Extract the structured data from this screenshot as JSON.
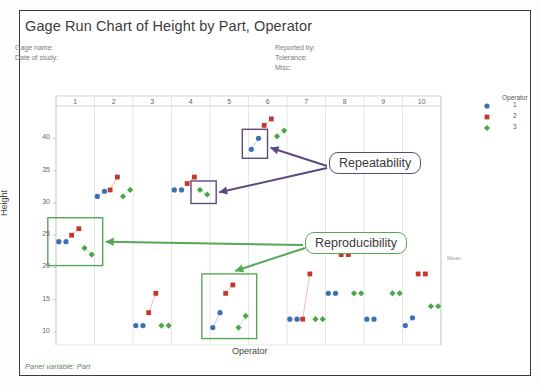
{
  "window": {
    "title": "Gage Run Chart of Height by Part, Operator"
  },
  "header": {
    "left": [
      "Gage name:",
      "Date of study:"
    ],
    "right": [
      "Reported by:",
      "Tolerance:",
      "Misc:"
    ]
  },
  "footnote": "Panel variable: Part",
  "mean_label": "Mean",
  "legend": {
    "title": "Operator",
    "entries": [
      {
        "label": "1",
        "marker": "circle",
        "color": "#3b6fb6"
      },
      {
        "label": "2",
        "marker": "square",
        "color": "#c0392b"
      },
      {
        "label": "3",
        "marker": "diamond",
        "color": "#4ca64c"
      }
    ]
  },
  "annotations": [
    {
      "name": "repeatability",
      "text": "Repeatability",
      "color": "#5b4a80"
    },
    {
      "name": "reproducibility",
      "text": "Reproducibility",
      "color": "#55a856"
    }
  ],
  "chart_data": {
    "type": "scatter",
    "title": "Gage Run Chart of Height by Part, Operator",
    "xlabel": "Operator",
    "ylabel": "Height",
    "panel_variable": "Part",
    "ylim": [
      8,
      45
    ],
    "yticks": [
      10,
      15,
      20,
      25,
      30,
      35,
      40
    ],
    "panels": [
      "1",
      "2",
      "3",
      "4",
      "5",
      "6",
      "7",
      "8",
      "9",
      "10"
    ],
    "grid": true,
    "legend_position": "right",
    "series": [
      {
        "name": "1",
        "marker": "circle",
        "color": "#3b6fb6",
        "points": [
          {
            "panel": "1",
            "reps": [
              24.0,
              24.0
            ]
          },
          {
            "panel": "2",
            "reps": [
              31.0,
              31.8
            ]
          },
          {
            "panel": "3",
            "reps": [
              11.0,
              11.0
            ]
          },
          {
            "panel": "4",
            "reps": [
              32.0,
              32.0
            ]
          },
          {
            "panel": "5",
            "reps": [
              10.7,
              13.0
            ]
          },
          {
            "panel": "6",
            "reps": [
              38.3,
              40.0
            ]
          },
          {
            "panel": "7",
            "reps": [
              12.0,
              12.0
            ]
          },
          {
            "panel": "8",
            "reps": [
              16.0,
              16.0
            ]
          },
          {
            "panel": "9",
            "reps": [
              12.0,
              12.0
            ]
          },
          {
            "panel": "10",
            "reps": [
              11.0,
              12.2
            ]
          }
        ]
      },
      {
        "name": "2",
        "marker": "square",
        "color": "#c0392b",
        "points": [
          {
            "panel": "1",
            "reps": [
              25.0,
              26.0
            ]
          },
          {
            "panel": "2",
            "reps": [
              32.0,
              34.0
            ]
          },
          {
            "panel": "3",
            "reps": [
              13.0,
              16.0
            ]
          },
          {
            "panel": "4",
            "reps": [
              33.0,
              34.0
            ]
          },
          {
            "panel": "5",
            "reps": [
              16.0,
              17.3
            ]
          },
          {
            "panel": "6",
            "reps": [
              42.0,
              43.0
            ]
          },
          {
            "panel": "7",
            "reps": [
              12.0,
              19.0
            ]
          },
          {
            "panel": "8",
            "reps": [
              22.0,
              22.0
            ]
          },
          {
            "panel": "9",
            "reps": [
              22.5,
              22.5
            ]
          },
          {
            "panel": "10",
            "reps": [
              19.0,
              19.0
            ]
          }
        ]
      },
      {
        "name": "3",
        "marker": "diamond",
        "color": "#4ca64c",
        "points": [
          {
            "panel": "1",
            "reps": [
              23.0,
              22.0
            ]
          },
          {
            "panel": "2",
            "reps": [
              31.0,
              32.0
            ]
          },
          {
            "panel": "3",
            "reps": [
              11.0,
              11.0
            ]
          },
          {
            "panel": "4",
            "reps": [
              32.0,
              31.3
            ]
          },
          {
            "panel": "5",
            "reps": [
              10.7,
              12.5
            ]
          },
          {
            "panel": "6",
            "reps": [
              40.3,
              41.2
            ]
          },
          {
            "panel": "7",
            "reps": [
              12.0,
              12.0
            ]
          },
          {
            "panel": "8",
            "reps": [
              16.0,
              16.0
            ]
          },
          {
            "panel": "9",
            "reps": [
              16.0,
              16.0
            ]
          },
          {
            "panel": "10",
            "reps": [
              14.0,
              14.0
            ]
          }
        ]
      }
    ],
    "highlight_boxes": [
      {
        "name": "repeatability-box-panel6",
        "color": "#5b4a80",
        "panel": "6",
        "series": "1"
      },
      {
        "name": "repeatability-box-panel4",
        "color": "#5b4a80",
        "panel": "4",
        "series": "3"
      },
      {
        "name": "reproducibility-box-panel1",
        "color": "#55a856",
        "panel": "1",
        "series": "all"
      },
      {
        "name": "reproducibility-box-panel5",
        "color": "#55a856",
        "panel": "5",
        "series": "all"
      }
    ]
  }
}
